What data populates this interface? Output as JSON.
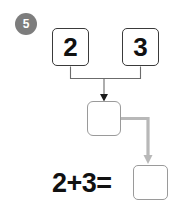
{
  "worksheet": {
    "step_number": "5",
    "problem_type": "number-bond-addition"
  },
  "number_bond": {
    "addend_a": "2",
    "addend_b": "3",
    "sum_box_value": "",
    "sum_box_placeholder": ""
  },
  "equation": {
    "text": "2+3=",
    "answer_value": "",
    "answer_placeholder": ""
  },
  "icons": {
    "arrow_down_to_sum": "arrow-down-icon",
    "arrow_sum_to_answer": "elbow-arrow-down-icon",
    "bracket": "bracket-connector"
  },
  "colors": {
    "badge_fill": "#7d7d7d",
    "badge_text": "#ffffff",
    "box_border_dark": "#3a3a3a",
    "box_border_gray": "#9a9a9a",
    "text": "#111111",
    "wire_dark": "#6b6b6b",
    "wire_gray": "#b3b3b3",
    "background": "#ffffff"
  }
}
